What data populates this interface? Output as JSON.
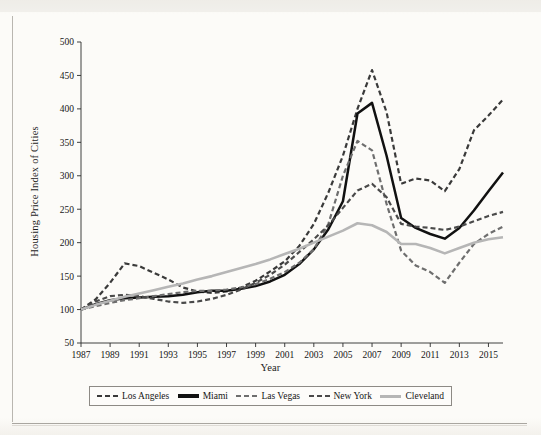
{
  "figure": {
    "xlabel": "Year",
    "ylabel": "Housing Price Index of Cities"
  },
  "legend": {
    "items": [
      {
        "label": "Los Angeles",
        "style": "dashed",
        "color": "#3a3a3a",
        "swatch": "sw-dash-dark"
      },
      {
        "label": "Miami",
        "style": "solid",
        "color": "#111111",
        "swatch": "sw-solid-black"
      },
      {
        "label": "Las Vegas",
        "style": "dashed",
        "color": "#6e6e6e",
        "swatch": "sw-dash-gray"
      },
      {
        "label": "New York",
        "style": "dashed",
        "color": "#4a4a4a",
        "swatch": "sw-dash-mid"
      },
      {
        "label": "Cleveland",
        "style": "solid",
        "color": "#b6b6b6",
        "swatch": "sw-solid-gray"
      }
    ]
  },
  "chart_data": {
    "type": "line",
    "title": "",
    "xlabel": "Year",
    "ylabel": "Housing Price Index of Cities",
    "xlim": [
      1987,
      2016
    ],
    "ylim": [
      50,
      500
    ],
    "yticks": [
      50,
      100,
      150,
      200,
      250,
      300,
      350,
      400,
      450,
      500
    ],
    "xticks": [
      1987,
      1989,
      1991,
      1993,
      1995,
      1997,
      1999,
      2001,
      2003,
      2005,
      2007,
      2009,
      2011,
      2013,
      2015
    ],
    "grid": false,
    "legend_position": "bottom",
    "x": [
      1987,
      1988,
      1989,
      1990,
      1991,
      1992,
      1993,
      1994,
      1995,
      1996,
      1997,
      1998,
      1999,
      2000,
      2001,
      2002,
      2003,
      2004,
      2005,
      2006,
      2007,
      2008,
      2009,
      2010,
      2011,
      2012,
      2013,
      2014,
      2015,
      2016
    ],
    "series": [
      {
        "name": "Los Angeles",
        "style": "dashed",
        "color": "#3a3a3a",
        "values": [
          100,
          115,
          140,
          169,
          165,
          155,
          145,
          133,
          127,
          125,
          127,
          133,
          143,
          157,
          172,
          195,
          228,
          275,
          330,
          400,
          458,
          395,
          288,
          296,
          293,
          277,
          310,
          368,
          390,
          414
        ]
      },
      {
        "name": "Miami",
        "style": "solid",
        "color": "#111111",
        "values": [
          100,
          108,
          114,
          117,
          118,
          119,
          120,
          122,
          126,
          128,
          128,
          131,
          135,
          142,
          152,
          168,
          190,
          220,
          262,
          393,
          409,
          330,
          237,
          222,
          213,
          206,
          222,
          248,
          277,
          305
        ]
      },
      {
        "name": "Las Vegas",
        "style": "dashed",
        "color": "#6e6e6e",
        "values": [
          100,
          105,
          110,
          114,
          117,
          120,
          123,
          126,
          128,
          128,
          130,
          133,
          138,
          146,
          156,
          170,
          190,
          228,
          300,
          352,
          338,
          258,
          188,
          166,
          156,
          140,
          170,
          198,
          213,
          224
        ]
      },
      {
        "name": "New York",
        "style": "dashed",
        "color": "#4a4a4a",
        "values": [
          100,
          112,
          120,
          122,
          120,
          116,
          112,
          110,
          112,
          116,
          122,
          130,
          140,
          152,
          167,
          186,
          205,
          226,
          252,
          278,
          288,
          268,
          228,
          224,
          222,
          219,
          224,
          232,
          240,
          246
        ]
      },
      {
        "name": "Cleveland",
        "style": "solid",
        "color": "#b6b6b6",
        "values": [
          100,
          107,
          113,
          119,
          124,
          129,
          134,
          139,
          145,
          150,
          156,
          162,
          168,
          175,
          183,
          191,
          200,
          209,
          218,
          229,
          226,
          216,
          198,
          198,
          192,
          184,
          192,
          200,
          205,
          208
        ]
      }
    ]
  }
}
